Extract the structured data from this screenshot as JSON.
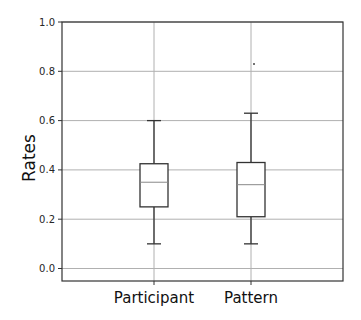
{
  "chart_data": {
    "type": "box",
    "title": "",
    "xlabel": "",
    "ylabel": "Rates",
    "ylim": [
      -0.05,
      1.0
    ],
    "yticks": [
      0.0,
      0.2,
      0.4,
      0.6,
      0.8,
      1.0
    ],
    "ytick_labels": [
      "0.0",
      "0.2",
      "0.4",
      "0.6",
      "0.8",
      "1.0"
    ],
    "grid": true,
    "categories": [
      "Participant",
      "Pattern"
    ],
    "series": [
      {
        "name": "Participant",
        "whisker_low": 0.1,
        "q1": 0.25,
        "median": 0.35,
        "q3": 0.425,
        "whisker_high": 0.6,
        "outliers": []
      },
      {
        "name": "Pattern",
        "whisker_low": 0.1,
        "q1": 0.21,
        "median": 0.34,
        "q3": 0.43,
        "whisker_high": 0.63,
        "outliers": [
          0.83
        ]
      }
    ],
    "colors": {
      "box": "#333333",
      "grid": "#b0b0b0",
      "spine": "#333333"
    }
  }
}
